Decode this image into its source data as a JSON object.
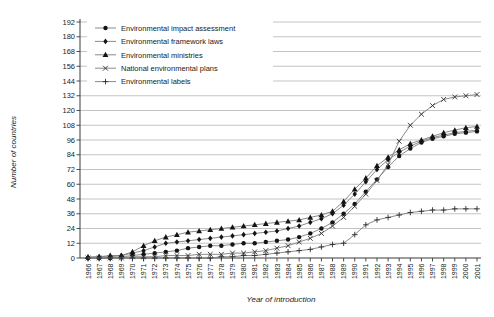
{
  "chart_data": {
    "type": "line",
    "title": "",
    "xlabel": "Year of introduction",
    "ylabel": "Number of countries",
    "x": [
      1966,
      1967,
      1968,
      1969,
      1970,
      1971,
      1972,
      1973,
      1974,
      1975,
      1976,
      1977,
      1978,
      1979,
      1980,
      1981,
      1982,
      1983,
      1984,
      1985,
      1986,
      1987,
      1988,
      1989,
      1990,
      1991,
      1992,
      1993,
      1994,
      1995,
      1996,
      1997,
      1998,
      1999,
      2000,
      2001
    ],
    "ylim": [
      0,
      192
    ],
    "ytick_step": 12,
    "grid": true,
    "legend_position": "top-left",
    "series": [
      {
        "name": "Environmental impact assessment",
        "marker": "circle",
        "values": [
          0,
          0,
          0,
          1,
          2,
          3,
          4,
          5,
          6,
          8,
          9,
          10,
          10,
          11,
          12,
          12,
          13,
          14,
          15,
          17,
          20,
          24,
          29,
          36,
          44,
          54,
          64,
          74,
          83,
          89,
          94,
          97,
          99,
          101,
          102,
          103
        ]
      },
      {
        "name": "Environmental framework laws",
        "marker": "diamond",
        "values": [
          0,
          1,
          1,
          2,
          4,
          6,
          9,
          12,
          13,
          14,
          15,
          16,
          17,
          18,
          19,
          20,
          21,
          22,
          24,
          26,
          29,
          32,
          36,
          43,
          52,
          62,
          72,
          80,
          86,
          91,
          95,
          98,
          100,
          102,
          103,
          104
        ]
      },
      {
        "name": "Environmental ministries",
        "marker": "triangle",
        "values": [
          1,
          1,
          2,
          2,
          5,
          10,
          14,
          17,
          19,
          21,
          22,
          23,
          24,
          25,
          26,
          27,
          28,
          29,
          30,
          31,
          33,
          35,
          38,
          46,
          56,
          65,
          75,
          82,
          88,
          93,
          96,
          99,
          102,
          104,
          106,
          107
        ]
      },
      {
        "name": "National environmental plans",
        "marker": "x",
        "values": [
          0,
          0,
          0,
          0,
          1,
          1,
          1,
          2,
          2,
          2,
          3,
          3,
          3,
          4,
          4,
          5,
          6,
          8,
          10,
          13,
          16,
          20,
          26,
          33,
          42,
          52,
          63,
          76,
          95,
          108,
          117,
          124,
          129,
          131,
          132,
          133
        ]
      },
      {
        "name": "Environmental labels",
        "marker": "plus",
        "values": [
          0,
          0,
          0,
          0,
          0,
          0,
          0,
          0,
          0,
          0,
          0,
          0,
          1,
          1,
          2,
          2,
          3,
          4,
          5,
          6,
          7,
          9,
          11,
          12,
          19,
          27,
          31,
          33,
          35,
          37,
          38,
          39,
          39,
          40,
          40,
          40
        ]
      }
    ]
  },
  "colors": {
    "line": "#7d7d7d",
    "marker_fill": "#141414",
    "marker_stroke": "#2e2e2e",
    "grid": "#9a9a9a",
    "axis": "#3a3a3a",
    "tick_text": "#2a2a2a",
    "legend_text": "#161616",
    "background": "#ffffff"
  }
}
